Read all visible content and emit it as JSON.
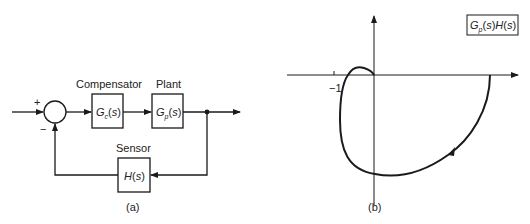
{
  "block_diagram": {
    "caption": "(a)",
    "sum_plus": "+",
    "sum_minus": "−",
    "compensator": {
      "title": "Compensator",
      "G": "G",
      "sub": "c",
      "arg": "(s)"
    },
    "plant": {
      "title": "Plant",
      "G": "G",
      "sub": "p",
      "arg": "(s)"
    },
    "sensor": {
      "title": "Sensor",
      "H": "H",
      "arg": "(s)"
    }
  },
  "nyquist_plot": {
    "caption": "(b)",
    "tick_label": "−1",
    "legend": {
      "G": "G",
      "sub": "p",
      "mid": "(s)",
      "H": "H",
      "end": "(s)"
    }
  },
  "colors": {
    "stroke": "#1a1a1a",
    "background": "#ffffff"
  }
}
